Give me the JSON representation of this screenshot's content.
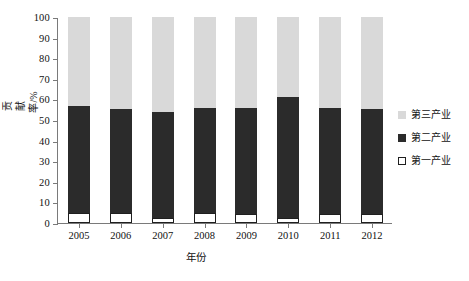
{
  "chart_data": {
    "type": "bar",
    "stacked": true,
    "title": "",
    "xlabel": "年份",
    "ylabel": "贡献率/%",
    "categories": [
      "2005",
      "2006",
      "2007",
      "2008",
      "2009",
      "2010",
      "2011",
      "2012"
    ],
    "ylim": [
      0,
      100
    ],
    "yticks": [
      0,
      10,
      20,
      30,
      40,
      50,
      60,
      70,
      80,
      90,
      100
    ],
    "ytick_labels": [
      "0",
      "10",
      "20",
      "30",
      "40",
      "50",
      "60",
      "70",
      "80",
      "90",
      "100"
    ],
    "grid": false,
    "legend_position": "right",
    "series": [
      {
        "name": "第一产业",
        "color": "#ffffff",
        "edge_color": "#1f1f1f",
        "values": [
          5.0,
          4.8,
          2.5,
          5.0,
          4.2,
          2.5,
          4.2,
          4.2
        ]
      },
      {
        "name": "第二产业",
        "color": "#2b2b2b",
        "values": [
          52.0,
          50.7,
          51.5,
          51.0,
          51.8,
          58.5,
          51.8,
          51.3
        ]
      },
      {
        "name": "第三产业",
        "color": "#d9d9d9",
        "values": [
          43.0,
          44.5,
          46.0,
          44.0,
          44.0,
          39.0,
          44.0,
          44.5
        ]
      }
    ],
    "stack_tops": {
      "primary": [
        5.0,
        4.8,
        2.5,
        5.0,
        4.2,
        2.5,
        4.2,
        4.2
      ],
      "secondary": [
        57.0,
        55.5,
        54.0,
        56.0,
        56.0,
        61.0,
        56.0,
        55.5
      ],
      "tertiary": [
        100,
        100,
        100,
        100,
        100,
        100,
        100,
        100
      ]
    }
  },
  "axes": {
    "y_title": "贡献率/%",
    "x_title": "年份"
  },
  "legend": {
    "items": [
      {
        "label": "第三产业",
        "swatch": "tertiary"
      },
      {
        "label": "第二产业",
        "swatch": "secondary"
      },
      {
        "label": "第一产业",
        "swatch": "primary"
      }
    ]
  }
}
